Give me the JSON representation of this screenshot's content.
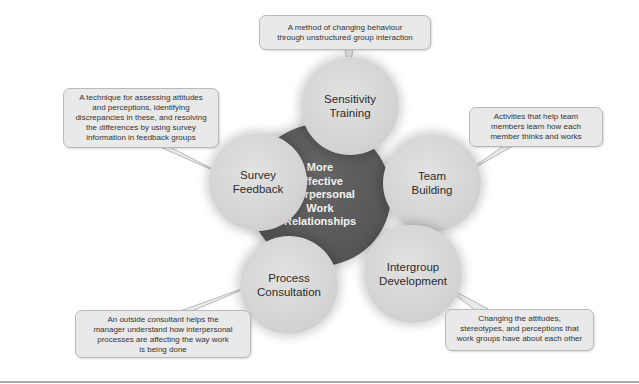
{
  "diagram": {
    "center": {
      "label": "More Effective Interpersonal Work Relationships",
      "lines": [
        "More",
        "Effective",
        "Interpersonal",
        "Work",
        "Relationships"
      ],
      "color": "#585858"
    },
    "nodes": [
      {
        "id": "sensitivity-training",
        "lines": [
          "Sensitivity",
          "Training"
        ],
        "description": [
          "A method of changing behaviour",
          "through unstructured group interaction"
        ]
      },
      {
        "id": "team-building",
        "lines": [
          "Team",
          "Building"
        ],
        "description": [
          "Activities that help team",
          "members learn how each",
          "member thinks and works"
        ]
      },
      {
        "id": "intergroup-development",
        "lines": [
          "Intergroup",
          "Development"
        ],
        "description": [
          "Changing the attitudes,",
          "stereotypes, and perceptions that",
          "work groups have about each other"
        ]
      },
      {
        "id": "process-consultation",
        "lines": [
          "Process",
          "Consultation"
        ],
        "description": [
          "An outside consultant helps the",
          "manager understand how interpersonal",
          "processes are affecting the way work",
          "is being done"
        ]
      },
      {
        "id": "survey-feedback",
        "lines": [
          "Survey",
          "Feedback"
        ],
        "description": [
          "A technique for assessing attitudes",
          "and perceptions, identifying",
          "discrepancies in these, and resolving",
          "the differences by using survey",
          "information in feedback groups"
        ]
      }
    ],
    "colors": {
      "outer_circle": "#d6d6d6",
      "callout_bg": "#e9e9e9",
      "callout_border": "#b9b9b9",
      "rule": "#a9a9a9"
    }
  }
}
